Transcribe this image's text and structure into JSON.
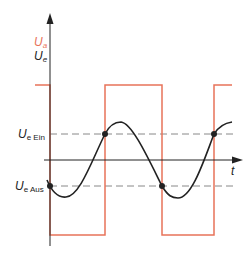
{
  "diagram": {
    "type": "schmitt-trigger-timing",
    "colors": {
      "output": "#e8735a",
      "input": "#222222",
      "axis": "#222222",
      "threshold": "#888888"
    },
    "labels": {
      "output_main": "U",
      "output_sub": "a",
      "input_main": "U",
      "input_sub": "e",
      "threshold_on_main": "U",
      "threshold_on_sub": "e Ein",
      "threshold_off_main": "U",
      "threshold_off_sub": "e Aus",
      "time_axis": "t"
    }
  }
}
